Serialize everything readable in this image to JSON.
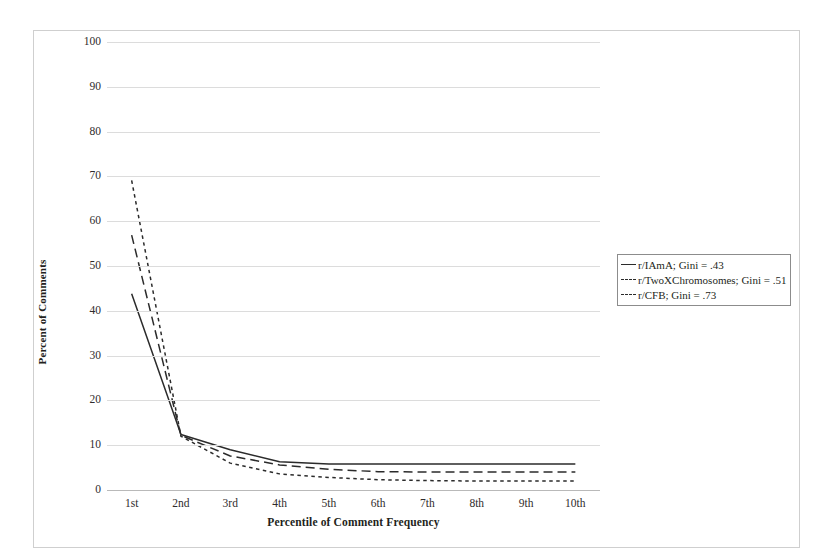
{
  "chart_data": {
    "type": "line",
    "title": "",
    "xlabel": "Percentile of Comment Frequency",
    "ylabel": "Percent of Comments",
    "categories": [
      "1st",
      "2nd",
      "3rd",
      "4th",
      "5th",
      "6th",
      "7th",
      "8th",
      "9th",
      "10th"
    ],
    "ylim": [
      0,
      100
    ],
    "ytick_labels": [
      "100",
      "90",
      "80",
      "70",
      "60",
      "50",
      "40",
      "30",
      "20",
      "10",
      "0"
    ],
    "ytick_values": [
      100,
      90,
      80,
      70,
      60,
      50,
      40,
      30,
      20,
      10,
      0
    ],
    "grid": true,
    "legend_position": "right",
    "series": [
      {
        "name": "r/IAmA; Gini = .43",
        "style": "solid",
        "color": "#2b2b2b",
        "values": [
          43.8,
          12.4,
          9.0,
          6.3,
          5.8,
          5.8,
          5.8,
          5.8,
          5.8,
          5.8
        ]
      },
      {
        "name": "r/TwoXChromosomes; Gini = .51",
        "style": "dashed",
        "color": "#2b2b2b",
        "values": [
          56.9,
          12.2,
          7.6,
          5.6,
          4.6,
          4.1,
          4.0,
          4.0,
          4.0,
          4.0
        ]
      },
      {
        "name": "r/CFB; Gini = .73",
        "style": "dotted",
        "color": "#2b2b2b",
        "values": [
          69.1,
          12.0,
          6.0,
          3.6,
          2.8,
          2.3,
          2.1,
          2.0,
          2.0,
          2.0
        ]
      }
    ]
  },
  "legend": {
    "entries": [
      {
        "label": "r/IAmA; Gini = .43",
        "style": "solid"
      },
      {
        "label": "r/TwoXChromosomes; Gini = .51",
        "style": "dashed"
      },
      {
        "label": "r/CFB; Gini = .73",
        "style": "dotted"
      }
    ]
  },
  "axes": {
    "y_title": "Percent of Comments",
    "x_title": "Percentile of Comment Frequency"
  }
}
